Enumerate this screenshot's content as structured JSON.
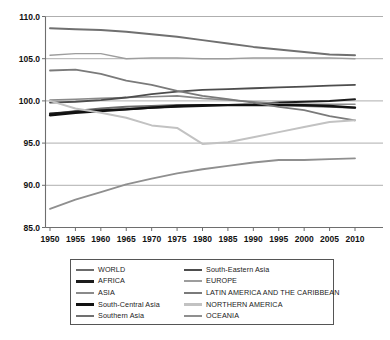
{
  "chart_data": {
    "type": "line",
    "title": "",
    "subtitle": "",
    "xlabel": "",
    "ylabel": "",
    "xlim": [
      1950,
      2010
    ],
    "ylim": [
      85.0,
      110.0
    ],
    "grid": true,
    "legend_position": "below",
    "x": [
      1950,
      1955,
      1960,
      1965,
      1970,
      1975,
      1980,
      1985,
      1990,
      1995,
      2000,
      2005,
      2010
    ],
    "xtick_labels": [
      "1950",
      "1955",
      "1960",
      "1965",
      "1970",
      "1975",
      "1980",
      "1985",
      "1990",
      "1995",
      "2000",
      "2005",
      "2010"
    ],
    "ytick_labels": [
      "85.0",
      "90.0",
      "95.0",
      "100.0",
      "105.0",
      "110.0"
    ],
    "ytick_values": [
      85.0,
      90.0,
      95.0,
      100.0,
      105.0,
      110.0
    ],
    "series": [
      {
        "name": "WORLD",
        "color": "#6b6b6b",
        "width": 2.0,
        "values": [
          98.4,
          98.8,
          99.1,
          99.3,
          99.4,
          99.5,
          99.5,
          99.5,
          99.5,
          99.5,
          99.4,
          99.3,
          99.2
        ]
      },
      {
        "name": "AFRICA",
        "color": "#1c1c1c",
        "width": 2.0,
        "values": [
          98.5,
          98.7,
          98.9,
          99.0,
          99.2,
          99.3,
          99.4,
          99.5,
          99.6,
          99.8,
          99.9,
          100.0,
          100.2
        ]
      },
      {
        "name": "ASIA",
        "color": "#8a8a8a",
        "width": 1.6,
        "values": [
          100.1,
          100.2,
          100.3,
          100.4,
          100.5,
          100.6,
          100.3,
          100.1,
          99.9,
          99.7,
          99.6,
          99.6,
          99.6
        ]
      },
      {
        "name": "South-Central Asia",
        "color": "#111111",
        "width": 2.4,
        "values": [
          98.3,
          98.6,
          98.8,
          99.0,
          99.2,
          99.4,
          99.5,
          99.5,
          99.5,
          99.5,
          99.5,
          99.4,
          99.2
        ]
      },
      {
        "name": "Southern Asia",
        "color": "#707070",
        "width": 2.0,
        "values": [
          108.6,
          108.5,
          108.4,
          108.2,
          107.9,
          107.6,
          107.2,
          106.8,
          106.4,
          106.1,
          105.8,
          105.5,
          105.4
        ]
      },
      {
        "name": "South-Eastern Asia",
        "color": "#4d4d4d",
        "width": 1.8,
        "values": [
          99.8,
          99.9,
          100.1,
          100.4,
          100.8,
          101.1,
          101.3,
          101.4,
          101.5,
          101.6,
          101.7,
          101.8,
          101.9
        ]
      },
      {
        "name": "EUROPE",
        "color": "#9d9d9d",
        "width": 1.4,
        "values": [
          105.4,
          105.6,
          105.6,
          105.0,
          105.1,
          105.1,
          105.0,
          105.0,
          105.1,
          105.1,
          105.1,
          105.1,
          105.0
        ]
      },
      {
        "name": "LATIN AMERICA AND THE CARIBBEAN",
        "color": "#7a7a7a",
        "width": 1.8,
        "values": [
          103.6,
          103.7,
          103.2,
          102.4,
          101.9,
          101.2,
          100.6,
          100.2,
          99.8,
          99.3,
          98.9,
          98.2,
          97.7
        ]
      },
      {
        "name": "NORTHERN AMERICA",
        "color": "#c2c2c2",
        "width": 2.0,
        "values": [
          100.0,
          99.1,
          98.6,
          98.0,
          97.1,
          96.8,
          94.9,
          95.1,
          95.7,
          96.3,
          96.9,
          97.5,
          97.7
        ]
      },
      {
        "name": "OCEANIA",
        "color": "#8f8f8f",
        "width": 1.8,
        "values": [
          87.2,
          88.3,
          89.2,
          90.1,
          90.8,
          91.4,
          91.9,
          92.3,
          92.7,
          93.0,
          93.0,
          93.1,
          93.2
        ]
      }
    ]
  },
  "legend": {
    "entries": [
      {
        "label": "WORLD",
        "color": "#6b6b6b",
        "thickness": "2.6px"
      },
      {
        "label": "South-Eastern Asia",
        "color": "#4d4d4d",
        "thickness": "2.4px"
      },
      {
        "label": "AFRICA",
        "color": "#1c1c1c",
        "thickness": "3px"
      },
      {
        "label": "EUROPE",
        "color": "#9d9d9d",
        "thickness": "2.2px"
      },
      {
        "label": "ASIA",
        "color": "#8a8a8a",
        "thickness": "2.2px"
      },
      {
        "label": "LATIN AMERICA AND THE CARIBBEAN",
        "color": "#7a7a7a",
        "thickness": "2.6px"
      },
      {
        "label": "South-Central Asia",
        "color": "#111111",
        "thickness": "3.2px"
      },
      {
        "label": "NORTHERN AMERICA",
        "color": "#c2c2c2",
        "thickness": "2.4px"
      },
      {
        "label": "Southern Asia",
        "color": "#707070",
        "thickness": "2.6px"
      },
      {
        "label": "OCEANIA",
        "color": "#8f8f8f",
        "thickness": "2.4px"
      }
    ]
  },
  "axes": {
    "grid_color": "#8d8d8d",
    "axis_color": "#6e6e6e"
  }
}
